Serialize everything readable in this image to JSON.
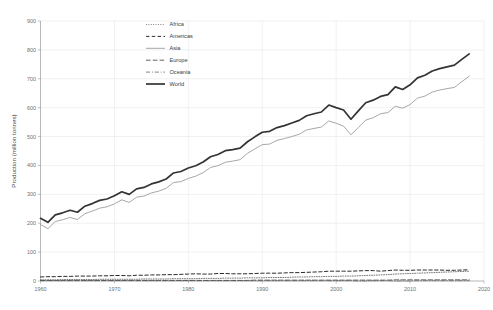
{
  "chart_data": {
    "type": "line",
    "title": "",
    "xlabel": "",
    "ylabel": "Production (million tonnes)",
    "xlim": [
      1960,
      2020
    ],
    "ylim": [
      0,
      900
    ],
    "x_ticks": [
      1960,
      1970,
      1980,
      1990,
      2000,
      2010,
      2020
    ],
    "y_ticks": [
      0,
      100,
      200,
      300,
      400,
      500,
      600,
      700,
      800,
      900
    ],
    "grid": true,
    "legend_position": "top-center",
    "x": [
      1960,
      1961,
      1962,
      1963,
      1964,
      1965,
      1966,
      1967,
      1968,
      1969,
      1970,
      1971,
      1972,
      1973,
      1974,
      1975,
      1976,
      1977,
      1978,
      1979,
      1980,
      1981,
      1982,
      1983,
      1984,
      1985,
      1986,
      1987,
      1988,
      1989,
      1990,
      1991,
      1992,
      1993,
      1994,
      1995,
      1996,
      1997,
      1998,
      1999,
      2000,
      2001,
      2002,
      2003,
      2004,
      2005,
      2006,
      2007,
      2008,
      2009,
      2010,
      2011,
      2012,
      2013,
      2014,
      2015,
      2016,
      2017,
      2018
    ],
    "series": [
      {
        "name": "Africa",
        "style": "dotted",
        "color": "#555555",
        "width": 0.8,
        "values": [
          4,
          4,
          4,
          5,
          5,
          5,
          5,
          5,
          6,
          6,
          6,
          6,
          6,
          6,
          7,
          7,
          7,
          7,
          8,
          8,
          8,
          8,
          9,
          9,
          9,
          10,
          10,
          10,
          11,
          11,
          11,
          12,
          12,
          12,
          13,
          14,
          14,
          15,
          15,
          16,
          16,
          17,
          17,
          18,
          19,
          20,
          21,
          22,
          24,
          25,
          26,
          27,
          28,
          29,
          30,
          31,
          32,
          33,
          34
        ]
      },
      {
        "name": "Americas",
        "style": "dashed",
        "color": "#2b2b2b",
        "width": 1.0,
        "values": [
          14,
          15,
          15,
          16,
          16,
          17,
          17,
          17,
          18,
          18,
          19,
          19,
          18,
          20,
          20,
          21,
          21,
          22,
          22,
          23,
          24,
          25,
          24,
          24,
          26,
          26,
          25,
          25,
          25,
          26,
          27,
          27,
          27,
          28,
          29,
          29,
          30,
          31,
          32,
          34,
          34,
          34,
          34,
          35,
          36,
          36,
          34,
          36,
          38,
          37,
          37,
          38,
          38,
          38,
          38,
          37,
          37,
          38,
          39
        ]
      },
      {
        "name": "Asia",
        "style": "solid",
        "color": "#9d9d9d",
        "width": 0.9,
        "values": [
          196,
          181,
          206,
          212,
          220,
          213,
          233,
          242,
          252,
          257,
          267,
          281,
          272,
          290,
          294,
          305,
          311,
          321,
          341,
          344,
          355,
          363,
          375,
          393,
          399,
          411,
          415,
          420,
          442,
          457,
          472,
          474,
          487,
          493,
          500,
          508,
          523,
          528,
          533,
          554,
          546,
          536,
          506,
          531,
          557,
          565,
          579,
          583,
          605,
          598,
          611,
          633,
          640,
          654,
          661,
          666,
          670,
          690,
          709
        ]
      },
      {
        "name": "Europe",
        "style": "longdash",
        "color": "#4f4f4f",
        "width": 0.9,
        "values": [
          2,
          2,
          2,
          2,
          2,
          2,
          2,
          2,
          2,
          2,
          2,
          2,
          2,
          2,
          2,
          2,
          2,
          2,
          2,
          2,
          2,
          2,
          2,
          2,
          2,
          2,
          2,
          2,
          2,
          3,
          3,
          3,
          3,
          3,
          3,
          3,
          3,
          3,
          3,
          3,
          3,
          3,
          3,
          3,
          3,
          3,
          3,
          3,
          4,
          4,
          4,
          4,
          4,
          4,
          4,
          4,
          4,
          4,
          4
        ]
      },
      {
        "name": "Oceania",
        "style": "dashdot",
        "color": "#787878",
        "width": 0.9,
        "values": [
          1,
          1,
          1,
          1,
          1,
          1,
          1,
          1,
          1,
          1,
          1,
          1,
          1,
          1,
          1,
          1,
          1,
          1,
          1,
          1,
          1,
          1,
          1,
          1,
          1,
          1,
          1,
          1,
          1,
          1,
          1,
          1,
          1,
          1,
          1,
          1,
          1,
          1,
          1,
          1,
          1,
          1,
          1,
          0,
          0,
          1,
          1,
          1,
          0,
          0,
          0,
          1,
          1,
          1,
          1,
          1,
          1,
          1,
          1
        ]
      },
      {
        "name": "World",
        "style": "solid",
        "color": "#333333",
        "width": 1.7,
        "values": [
          217,
          203,
          229,
          236,
          245,
          238,
          259,
          268,
          279,
          284,
          295,
          309,
          300,
          319,
          324,
          336,
          343,
          353,
          374,
          379,
          391,
          399,
          412,
          430,
          438,
          451,
          455,
          460,
          482,
          499,
          515,
          518,
          531,
          538,
          547,
          556,
          572,
          579,
          585,
          609,
          600,
          592,
          560,
          589,
          617,
          626,
          639,
          645,
          672,
          663,
          679,
          703,
          712,
          727,
          735,
          741,
          747,
          767,
          786
        ]
      }
    ]
  },
  "axis": {
    "y_title": "Production (million tonnes)",
    "y_tick_labels": [
      "0",
      "100",
      "200",
      "300",
      "400",
      "500",
      "600",
      "700",
      "800",
      "900"
    ],
    "x_tick_labels": [
      "1960",
      "1970",
      "1980",
      "1990",
      "2000",
      "2010",
      "2020"
    ]
  },
  "legend": {
    "items": [
      {
        "label": "Africa"
      },
      {
        "label": "Americas"
      },
      {
        "label": "Asia"
      },
      {
        "label": "Europe"
      },
      {
        "label": "Oceania"
      },
      {
        "label": "World"
      }
    ]
  }
}
